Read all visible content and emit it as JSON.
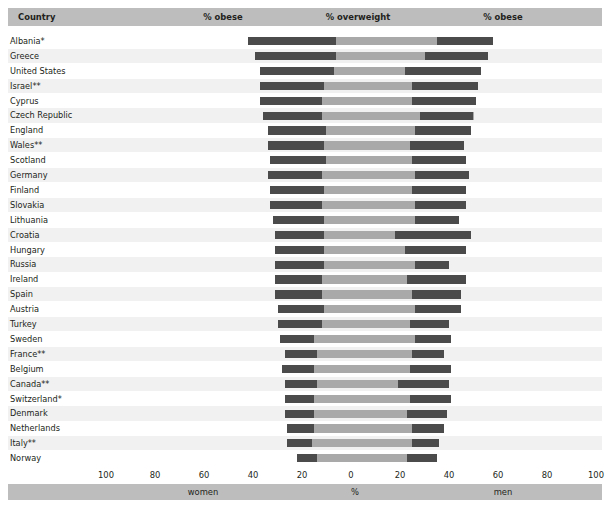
{
  "header": {
    "country_label": "Country",
    "obese_women_label": "% obese",
    "overweight_label": "% overweight",
    "obese_men_label": "% obese"
  },
  "footer": {
    "women_label": "women",
    "percent_label": "%",
    "men_label": "men"
  },
  "colors": {
    "obese": "#4b4b4b",
    "overweight": "#a9a9a9",
    "band": "#bdbdbd",
    "row_alt": "#f1f1f1",
    "background": "#ffffff",
    "text": "#231f20"
  },
  "chart_data": {
    "type": "bar",
    "title": "",
    "subtitle": "",
    "orientation": "horizontal-diverging",
    "xlabel": "%",
    "ylabel": "Country",
    "xlim": [
      -100,
      100
    ],
    "xticks": [
      100,
      80,
      60,
      40,
      20,
      0,
      20,
      40,
      60,
      80,
      100
    ],
    "grid": true,
    "legend": [
      "% obese",
      "% overweight"
    ],
    "legend_position": "header",
    "left_group": "women",
    "right_group": "men",
    "categories": [
      "Albania*",
      "Greece",
      "United States",
      "Israel**",
      "Cyprus",
      "Czech Republic",
      "England",
      "Wales**",
      "Scotland",
      "Germany",
      "Finland",
      "Slovakia",
      "Lithuania",
      "Croatia",
      "Hungary",
      "Russia",
      "Ireland",
      "Spain",
      "Austria",
      "Turkey",
      "Sweden",
      "France**",
      "Belgium",
      "Canada**",
      "Switzerland*",
      "Denmark",
      "Netherlands",
      "Italy**",
      "Norway"
    ],
    "series": [
      {
        "name": "women % obese",
        "side": "left",
        "values": [
          36,
          33,
          30,
          26,
          25,
          24,
          24,
          23,
          23,
          22,
          22,
          21,
          21,
          20,
          20,
          20,
          19,
          19,
          19,
          18,
          14,
          13,
          13,
          13,
          12,
          12,
          11,
          10,
          8
        ]
      },
      {
        "name": "women % overweight",
        "side": "left",
        "values": [
          42,
          39,
          37,
          37,
          37,
          36,
          34,
          34,
          33,
          34,
          33,
          33,
          32,
          31,
          31,
          31,
          31,
          31,
          30,
          30,
          29,
          27,
          28,
          27,
          27,
          27,
          26,
          26,
          22
        ]
      },
      {
        "name": "men % obese",
        "side": "right",
        "values": [
          23,
          26,
          31,
          27,
          26,
          22,
          23,
          22,
          22,
          22,
          22,
          21,
          18,
          31,
          25,
          14,
          24,
          20,
          19,
          16,
          15,
          13,
          17,
          21,
          17,
          16,
          13,
          11,
          12
        ]
      },
      {
        "name": "men % overweight",
        "side": "right",
        "values": [
          58,
          56,
          53,
          52,
          51,
          50,
          49,
          46,
          47,
          48,
          47,
          47,
          44,
          49,
          47,
          40,
          47,
          45,
          45,
          40,
          41,
          38,
          41,
          40,
          41,
          39,
          38,
          36,
          35
        ]
      }
    ]
  }
}
